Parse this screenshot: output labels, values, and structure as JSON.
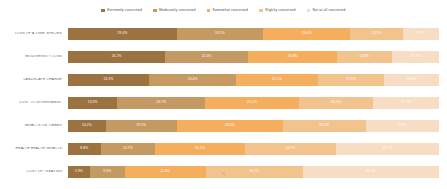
{
  "chart_data": {
    "type": "bar",
    "subtype": "stacked-horizontal-100-percent",
    "title": "",
    "subtitle": "",
    "xlabel": "",
    "ylabel": "",
    "xlim": [
      0,
      100
    ],
    "grid": false,
    "legend_position": "top-center",
    "value_suffix": "%",
    "categories": [
      "LOSS OF A TREE SPECIES",
      "BIODIVERSITY LOSS",
      "LANDSCAPE CHANGE",
      "COST TO GOVERNMENT",
      "IMPACTS ON TIMBER",
      "HEALTH HEALTH IMPACTS",
      "COST OF TREATING"
    ],
    "series": [
      {
        "name": "Extremely concerned",
        "color": "#9c7240",
        "values": [
          29.4,
          26.2,
          21.9,
          13.3,
          10.2,
          8.8,
          5.9
        ]
      },
      {
        "name": "Moderately concerned",
        "color": "#c49a62",
        "values": [
          23.1,
          22.4,
          23.4,
          23.7,
          19.1,
          14.7,
          9.4
        ]
      },
      {
        "name": "Somewhat concerned",
        "color": "#f5ad5e",
        "values": [
          23.6,
          23.8,
          22.1,
          25.2,
          28.6,
          24.1,
          21.8
        ]
      },
      {
        "name": "Slightly concerned",
        "color": "#f3c38e",
        "values": [
          14.2,
          14.9,
          17.8,
          20.1,
          22.3,
          24.7,
          26.2
        ]
      },
      {
        "name": "Not at all concerned",
        "color": "#f7ddc3",
        "values": [
          9.7,
          12.7,
          14.8,
          17.7,
          19.8,
          27.7,
          36.7
        ]
      }
    ]
  },
  "legend": {
    "items": [
      {
        "label": "Extremely concerned",
        "color": "#9c7240"
      },
      {
        "label": "Moderately concerned",
        "color": "#c49a62"
      },
      {
        "label": "Somewhat concerned",
        "color": "#f5ad5e"
      },
      {
        "label": "Slightly concerned",
        "color": "#f3c38e"
      },
      {
        "label": "Not at all concerned",
        "color": "#f7ddc3"
      }
    ]
  },
  "footer": {
    "note": "%"
  }
}
